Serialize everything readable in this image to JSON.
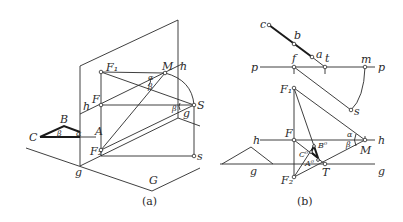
{
  "figure_a": {
    "caption": "(a)",
    "labels": {
      "F1": "F₁",
      "F": "F",
      "F2": "F₂",
      "M": "M",
      "h_top": "h",
      "h_left": "h",
      "S": "S",
      "s": "s",
      "g_right": "g",
      "g_bottom": "g",
      "G": "G",
      "A": "A",
      "B": "B",
      "C": "C",
      "alpha": "α",
      "beta": "β"
    }
  },
  "figure_b": {
    "caption": "(b)",
    "labels": {
      "c": "c",
      "b": "b",
      "a": "a",
      "p_left": "p",
      "p_right": "p",
      "f": "f",
      "t": "t",
      "m": "m",
      "s": "s",
      "F1": "F₁",
      "F": "F",
      "F2": "F₂",
      "h_left": "h",
      "h_right": "h",
      "g_left": "g",
      "g_mid": "g",
      "g_right": "g",
      "M": "M",
      "T": "T",
      "A0": "A⁰",
      "B0": "B⁰",
      "C0": "C⁰",
      "alpha": "α",
      "beta": "β"
    }
  }
}
